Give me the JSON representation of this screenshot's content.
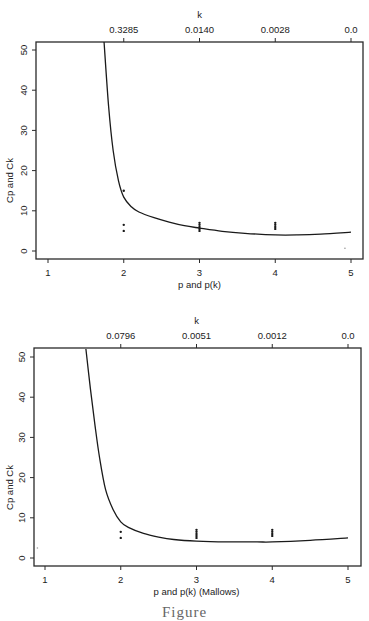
{
  "figure": {
    "caption": "Figure"
  },
  "chart_data": [
    {
      "type": "line",
      "title": "",
      "xlabel": "p and p(k)",
      "ylabel": "Cp and Ck",
      "top_axis_label": "k",
      "top_axis_ticks": [
        {
          "x": 2,
          "label": "0.3285"
        },
        {
          "x": 3,
          "label": "0.0140"
        },
        {
          "x": 4,
          "label": "0.0028"
        },
        {
          "x": 5,
          "label": "0.0"
        }
      ],
      "xticks": [
        "1",
        "2",
        "3",
        "4",
        "5"
      ],
      "yticks": [
        "0",
        "10",
        "20",
        "30",
        "40",
        "50"
      ],
      "xlim": [
        0.84,
        5.16
      ],
      "ylim": [
        -2,
        52
      ],
      "grid": false,
      "legend": null,
      "series": [
        {
          "name": "Ck curve",
          "kind": "line",
          "x": [
            1.74,
            1.8,
            1.86,
            1.93,
            2.0,
            2.1,
            2.2,
            2.4,
            2.6,
            2.8,
            3.0,
            3.3,
            3.6,
            4.0,
            4.3,
            4.6,
            5.0
          ],
          "y": [
            52,
            36,
            25,
            17.5,
            13.4,
            11,
            9.7,
            8.3,
            7.2,
            6.3,
            5.7,
            4.9,
            4.4,
            4.0,
            4.0,
            4.2,
            4.7
          ]
        },
        {
          "name": "Cp points",
          "kind": "scatter",
          "x": [
            2,
            2,
            2,
            3,
            3,
            3,
            3,
            3,
            4,
            4,
            4,
            4,
            4.92
          ],
          "y": [
            15,
            6.5,
            5,
            7,
            6.5,
            6,
            5.5,
            5,
            7,
            6.5,
            6,
            5.5,
            0.7
          ]
        }
      ]
    },
    {
      "type": "line",
      "title": "",
      "xlabel": "p and p(k) (Mallows)",
      "ylabel": "Cp and Ck",
      "top_axis_label": "k",
      "top_axis_ticks": [
        {
          "x": 2,
          "label": "0.0796"
        },
        {
          "x": 3,
          "label": "0.0051"
        },
        {
          "x": 4,
          "label": "0.0012"
        },
        {
          "x": 5,
          "label": "0.0"
        }
      ],
      "xticks": [
        "1",
        "2",
        "3",
        "4",
        "5"
      ],
      "yticks": [
        "0",
        "10",
        "20",
        "30",
        "40",
        "50"
      ],
      "xlim": [
        0.84,
        5.16
      ],
      "ylim": [
        -2,
        52
      ],
      "grid": false,
      "legend": null,
      "series": [
        {
          "name": "Ck curve",
          "kind": "line",
          "x": [
            1.54,
            1.6,
            1.66,
            1.72,
            1.8,
            1.9,
            2.0,
            2.1,
            2.3,
            2.5,
            2.7,
            3.0,
            3.4,
            3.8,
            4.0,
            4.5,
            5.0
          ],
          "y": [
            52,
            42,
            33,
            25,
            17,
            12,
            9,
            7.6,
            6.1,
            5.2,
            4.6,
            4.2,
            4.0,
            4.0,
            4.0,
            4.4,
            5.0
          ]
        },
        {
          "name": "Cp points",
          "kind": "scatter",
          "x": [
            2,
            2,
            3,
            3,
            3,
            3,
            3,
            4,
            4,
            4,
            4,
            0.9
          ],
          "y": [
            6.5,
            5,
            7,
            6.5,
            6,
            5.5,
            5,
            7,
            6.5,
            6,
            5.5,
            2.5
          ]
        }
      ]
    }
  ]
}
